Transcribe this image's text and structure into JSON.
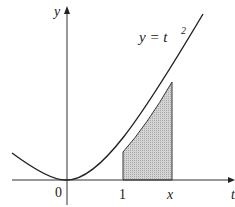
{
  "figure": {
    "curve_label": "y = t",
    "curve_exponent": "2",
    "y_axis_label": "y",
    "x_axis_label": "t",
    "ticks": {
      "origin": "0",
      "one": "1",
      "x": "x"
    },
    "colors": {
      "stroke": "#222222",
      "shade": "#c8c8c8"
    }
  }
}
